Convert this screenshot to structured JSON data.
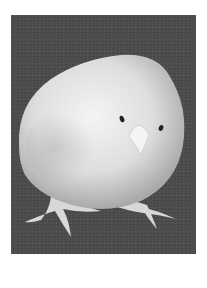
{
  "figure": {
    "background_color": "#4b4b4b",
    "body_color": "#e6e6e6",
    "eye_color": "#222222",
    "beak_color": "#f2f2f2",
    "feet_color": "#dcdcdc"
  }
}
